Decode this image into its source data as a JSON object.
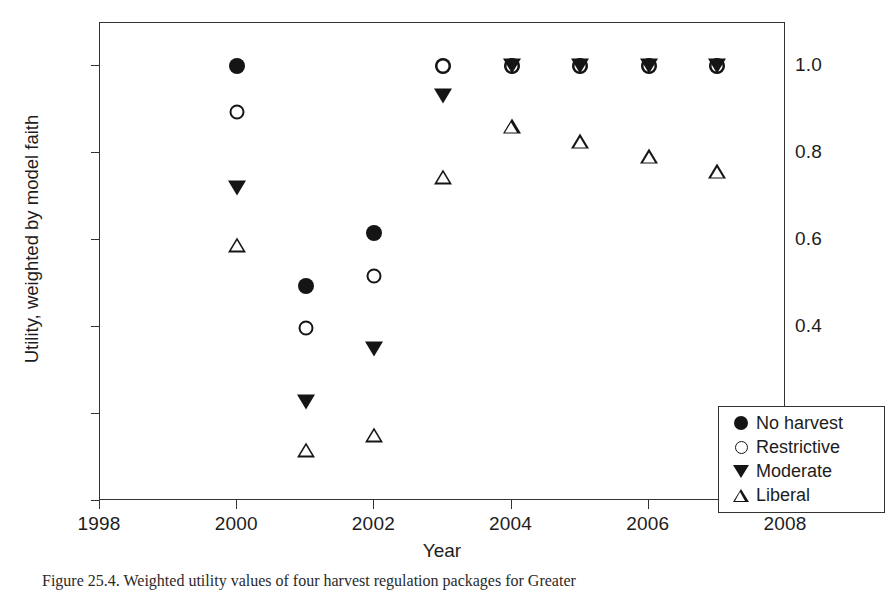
{
  "figure": {
    "caption": "Figure 25.4. Weighted utility values of four harvest regulation packages for Greater"
  },
  "chart_data": {
    "type": "scatter",
    "title": "",
    "xlabel": "Year",
    "ylabel": "Utility, weighted by model faith",
    "xlim": [
      1998,
      2008
    ],
    "ylim": [
      0.0,
      1.1
    ],
    "xticks": [
      "1998",
      "2000",
      "2002",
      "2004",
      "2006",
      "2008"
    ],
    "xtick_values": [
      1998,
      2000,
      2002,
      2004,
      2006,
      2008
    ],
    "yticks": [
      "0.0",
      "0.2",
      "0.4",
      "0.6",
      "0.8",
      "1.0"
    ],
    "ytick_values": [
      0.0,
      0.2,
      0.4,
      0.6,
      0.8,
      1.0
    ],
    "grid": false,
    "legend_position": "lower right",
    "x": [
      2000,
      2001,
      2002,
      2003,
      2004,
      2005,
      2006,
      2007
    ],
    "series": [
      {
        "name": "No harvest",
        "marker": "filled-circle",
        "values": [
          1.0,
          0.495,
          0.615,
          1.0,
          1.0,
          1.0,
          1.0,
          1.0
        ]
      },
      {
        "name": "Restrictive",
        "marker": "open-circle",
        "values": [
          0.895,
          0.397,
          0.518,
          1.0,
          1.0,
          1.0,
          1.0,
          1.0
        ]
      },
      {
        "name": "Moderate",
        "marker": "filled-triangle-down",
        "values": [
          0.72,
          0.227,
          0.349,
          0.931,
          1.0,
          1.0,
          1.0,
          1.0
        ]
      },
      {
        "name": "Liberal",
        "marker": "open-triangle-up",
        "values": [
          0.589,
          0.152,
          0.221,
          0.849,
          1.0,
          1.0,
          1.0,
          1.0
        ]
      }
    ]
  },
  "legend": {
    "items": [
      {
        "label": "No harvest",
        "marker": "filled-circle"
      },
      {
        "label": "Restrictive",
        "marker": "open-circle"
      },
      {
        "label": "Moderate",
        "marker": "filled-triangle-down"
      },
      {
        "label": "Liberal",
        "marker": "open-triangle-up"
      }
    ]
  },
  "colors": {
    "marker": "#151515",
    "axis": "#333333",
    "text": "#1d1d1d",
    "background": "#ffffff"
  }
}
